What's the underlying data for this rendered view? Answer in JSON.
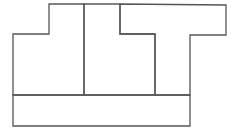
{
  "diagram": {
    "width": 239,
    "height": 134,
    "stroke": "#555555",
    "background": "#ffffff",
    "pieces": [
      {
        "name": "left-step-piece",
        "points": "13,34 49,34 49,4 84,4 84,95 13,95"
      },
      {
        "name": "middle-piece",
        "points": "84,4 120,4 120,34 155,34 155,95 84,95"
      },
      {
        "name": "right-t-piece",
        "points": "120,4 226,5 226,35 190,35 190,95 155,95 155,34 120,34"
      },
      {
        "name": "bottom-bar-piece",
        "points": "13,95 190,95 190,126 13,126"
      }
    ]
  }
}
